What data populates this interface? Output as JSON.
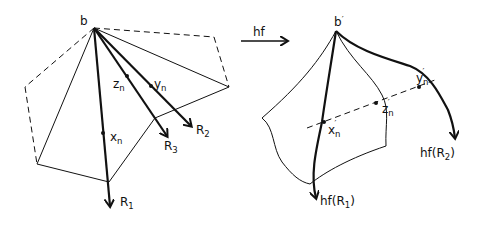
{
  "left_figure": {
    "base_point": "b",
    "points": {
      "x": "x",
      "y": "y",
      "z": "z",
      "subscript": "n"
    },
    "rays": [
      {
        "name": "R",
        "subscript": "1"
      },
      {
        "name": "R",
        "subscript": "2"
      },
      {
        "name": "R",
        "subscript": "3"
      }
    ]
  },
  "map_arrow": {
    "label": "hf"
  },
  "right_figure": {
    "base_point": "b",
    "prime": "′",
    "points": {
      "x": "x",
      "y": "y",
      "z": "z",
      "subscript": "n"
    },
    "images": [
      {
        "prefix": "hf(",
        "name": "R",
        "subscript": "1",
        "suffix": ")"
      },
      {
        "prefix": "hf(",
        "name": "R",
        "subscript": "2",
        "suffix": ")"
      }
    ]
  },
  "colors": {
    "ink": "#111111",
    "background": "#ffffff"
  }
}
